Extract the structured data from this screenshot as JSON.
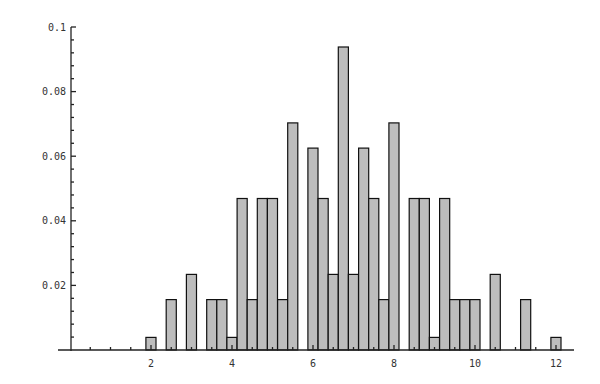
{
  "chart_data": {
    "type": "bar",
    "title": "",
    "xlabel": "",
    "ylabel": "",
    "xlim": [
      0.0,
      12.5
    ],
    "ylim": [
      0,
      0.1
    ],
    "grid": false,
    "legend": null,
    "bin_width": 0.25,
    "x_ticks": [
      2,
      4,
      6,
      8,
      10,
      12
    ],
    "y_ticks": [
      0.02,
      0.04,
      0.06,
      0.08,
      0.1
    ],
    "y_tick_labels": [
      "0.02",
      "0.04",
      "0.06",
      "0.08",
      "0.1"
    ],
    "x": [
      2.0,
      2.5,
      3.0,
      3.5,
      3.75,
      4.0,
      4.25,
      4.5,
      4.75,
      5.0,
      5.25,
      5.5,
      6.0,
      6.25,
      6.5,
      6.75,
      7.0,
      7.25,
      7.5,
      7.75,
      8.0,
      8.5,
      8.75,
      9.0,
      9.25,
      9.5,
      9.75,
      10.0,
      10.5,
      11.25,
      12.0
    ],
    "values": [
      0.0039,
      0.0156,
      0.0234,
      0.0156,
      0.0156,
      0.0039,
      0.0469,
      0.0156,
      0.0469,
      0.0469,
      0.0156,
      0.0703,
      0.0625,
      0.0469,
      0.0234,
      0.0938,
      0.0234,
      0.0625,
      0.0469,
      0.0156,
      0.0703,
      0.0469,
      0.0469,
      0.0039,
      0.0469,
      0.0156,
      0.0156,
      0.0156,
      0.0234,
      0.0156,
      0.0039
    ]
  },
  "colors": {
    "bar_fill": "#bdbdbd",
    "bar_stroke": "#111111",
    "axis": "#222222"
  }
}
